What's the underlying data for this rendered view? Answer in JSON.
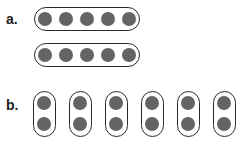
{
  "colors": {
    "dot": "#646464",
    "outline": "#2a2a2a"
  },
  "part_a": {
    "label": "a.",
    "rows": [
      {
        "dots": 5
      },
      {
        "dots": 5
      }
    ]
  },
  "part_b": {
    "label": "b.",
    "groups": [
      {
        "dots": 2
      },
      {
        "dots": 2
      },
      {
        "dots": 2
      },
      {
        "dots": 2
      },
      {
        "dots": 2
      },
      {
        "dots": 2
      }
    ]
  }
}
